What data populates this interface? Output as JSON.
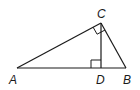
{
  "diagram": {
    "type": "right-triangle-with-altitude",
    "stroke_color": "#1a1a1a",
    "points": {
      "A": {
        "x": 17,
        "y": 68
      },
      "B": {
        "x": 126,
        "y": 68
      },
      "C": {
        "x": 101,
        "y": 23
      },
      "D": {
        "x": 101,
        "y": 68
      }
    },
    "labels": {
      "A": "A",
      "B": "B",
      "C": "C",
      "D": "D"
    },
    "right_angles": [
      "C",
      "D"
    ]
  }
}
